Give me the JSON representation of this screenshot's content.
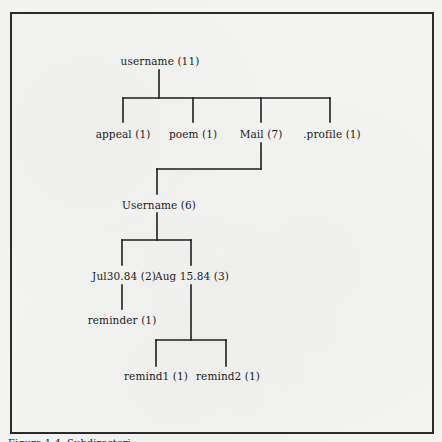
{
  "diagram": {
    "type": "directory-tree",
    "nodes": {
      "root": {
        "label": "username (11)",
        "name": "username",
        "count": 11
      },
      "appeal": {
        "label": "appeal (1)",
        "name": "appeal",
        "count": 1
      },
      "poem": {
        "label": "poem (1)",
        "name": "poem",
        "count": 1
      },
      "mail": {
        "label": "Mail (7)",
        "name": "Mail",
        "count": 7
      },
      "profile": {
        "label": ".profile (1)",
        "name": ".profile",
        "count": 1
      },
      "username_sub": {
        "label": "Username (6)",
        "name": "Username",
        "count": 6
      },
      "jul": {
        "label": "Jul30.84 (2)",
        "name": "Jul30.84",
        "count": 2
      },
      "aug": {
        "label": "Aug 15.84 (3)",
        "name": "Aug 15.84",
        "count": 3
      },
      "reminder": {
        "label": "reminder (1)",
        "name": "reminder",
        "count": 1
      },
      "remind1": {
        "label": "remind1 (1)",
        "name": "remind1",
        "count": 1
      },
      "remind2": {
        "label": "remind2 (1)",
        "name": "remind2",
        "count": 1
      }
    },
    "edges": [
      [
        "root",
        "appeal"
      ],
      [
        "root",
        "poem"
      ],
      [
        "root",
        "mail"
      ],
      [
        "root",
        "profile"
      ],
      [
        "mail",
        "username_sub"
      ],
      [
        "username_sub",
        "jul"
      ],
      [
        "username_sub",
        "aug"
      ],
      [
        "jul",
        "reminder"
      ],
      [
        "aug",
        "remind1"
      ],
      [
        "aug",
        "remind2"
      ]
    ]
  },
  "caption": "Figure 1.4. Subdirectori"
}
